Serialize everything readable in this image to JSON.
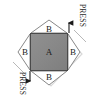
{
  "figure": {
    "center_part": {
      "label": "A",
      "shape": "square",
      "fill_color": "#8a8a8a",
      "stroke_color": "#4a4a4a"
    },
    "wedges": [
      {
        "id": "top",
        "label": "B",
        "fill_color": "#ffffff",
        "stroke_color": "#7a7a7a"
      },
      {
        "id": "right",
        "label": "B",
        "fill_color": "#ffffff",
        "stroke_color": "#7a7a7a"
      },
      {
        "id": "bottom",
        "label": "B",
        "fill_color": "#ffffff",
        "stroke_color": "#7a7a7a"
      },
      {
        "id": "left",
        "label": "B",
        "fill_color": "#ffffff",
        "stroke_color": "#7a7a7a"
      }
    ],
    "annotations": [
      {
        "id": "press-top-right",
        "text": "PRESS",
        "arrow": "up",
        "rotation_deg": 90
      },
      {
        "id": "press-bottom-left",
        "text": "PRESS",
        "arrow": "down",
        "rotation_deg": 90
      }
    ],
    "colors": {
      "background": "#ffffff",
      "arrow": "#1a1a1a",
      "outline": "#7a7a7a",
      "shadow": "#cfcfcf"
    }
  }
}
